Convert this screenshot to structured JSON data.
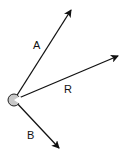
{
  "diagram": {
    "type": "vector-diagram",
    "origin": {
      "x": 14,
      "y": 100,
      "radius": 6,
      "fill": "#c8c8c8",
      "stroke": "#222222"
    },
    "vectors": [
      {
        "id": "A",
        "label": "A",
        "from": [
          14,
          100
        ],
        "to": [
          71,
          10
        ],
        "label_pos": [
          33,
          49
        ]
      },
      {
        "id": "R",
        "label": "R",
        "from": [
          14,
          100
        ],
        "to": [
          118,
          56
        ],
        "label_pos": [
          64,
          93
        ]
      },
      {
        "id": "B",
        "label": "B",
        "from": [
          14,
          100
        ],
        "to": [
          59,
          148
        ],
        "label_pos": [
          27,
          139
        ]
      }
    ],
    "colors": {
      "line": "#111111",
      "background": "#ffffff"
    }
  }
}
